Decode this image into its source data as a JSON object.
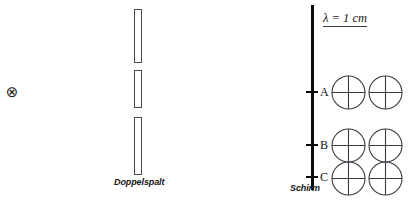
{
  "figure": {
    "width": 410,
    "height": 201,
    "background": "#ffffff",
    "stroke_color": "#4a4a52",
    "screen_color": "#0a0a0a",
    "text_color": "#141414"
  },
  "source": {
    "symbol": "⊗",
    "icon_name": "wave-source-cross-circle-icon",
    "x": 11,
    "y": 92
  },
  "barrier": {
    "label": "Doppelspalt",
    "label_x": 114,
    "label_y": 177,
    "bar_x": 134,
    "bar_width": 8,
    "bars": [
      {
        "name": "upper-blocker",
        "top": 9,
        "height": 54
      },
      {
        "name": "middle-blocker",
        "top": 70,
        "height": 38
      },
      {
        "name": "lower-blocker",
        "top": 117,
        "height": 58
      }
    ],
    "slits": [
      {
        "name": "upper-slit",
        "top": 63,
        "height": 7
      },
      {
        "name": "lower-slit",
        "top": 108,
        "height": 9
      }
    ]
  },
  "screen": {
    "label": "Schirm",
    "label_x": 290,
    "label_y": 183,
    "line_x": 311,
    "line_width": 2.6,
    "line_top": 5,
    "line_height": 185,
    "points": [
      {
        "id": "A",
        "label": "A",
        "y": 92,
        "tick_x": 306,
        "tick_width": 12,
        "label_x": 320
      },
      {
        "id": "B",
        "label": "B",
        "y": 145,
        "tick_x": 306,
        "tick_width": 12,
        "label_x": 320
      },
      {
        "id": "C",
        "label": "C",
        "y": 177,
        "tick_x": 306,
        "tick_width": 12,
        "label_x": 320
      }
    ]
  },
  "annotation": {
    "wavelength_text": "λ = 1 cm",
    "x": 323,
    "y": 12
  },
  "phasor_circles": [
    {
      "name": "phasor-A-1",
      "row": "A",
      "col": 1,
      "cx": 348,
      "cy": 92,
      "r": 16.5
    },
    {
      "name": "phasor-A-2",
      "row": "A",
      "col": 2,
      "cx": 385,
      "cy": 92,
      "r": 16.5
    },
    {
      "name": "phasor-B-1",
      "row": "B",
      "col": 1,
      "cx": 348,
      "cy": 145,
      "r": 16.5
    },
    {
      "name": "phasor-B-2",
      "row": "B",
      "col": 2,
      "cx": 385,
      "cy": 145,
      "r": 16.5
    },
    {
      "name": "phasor-C-1",
      "row": "C",
      "col": 1,
      "cx": 348,
      "cy": 178,
      "r": 16.5
    },
    {
      "name": "phasor-C-2",
      "row": "C",
      "col": 2,
      "cx": 385,
      "cy": 178,
      "r": 16.5
    }
  ]
}
